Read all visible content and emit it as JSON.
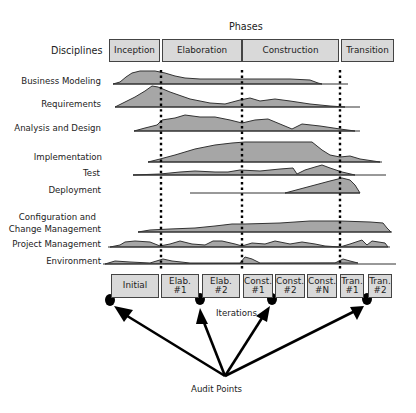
{
  "title": "Phases",
  "disciplines_header": "Disciplines",
  "phases": [
    {
      "label": "Inception"
    },
    {
      "label": "Elaboration"
    },
    {
      "label": "Construction"
    },
    {
      "label": "Transition"
    }
  ],
  "disciplines": [
    {
      "label": "Business Modeling"
    },
    {
      "label": "Requirements"
    },
    {
      "label": "Analysis and Design"
    },
    {
      "label": "Implementation"
    },
    {
      "label": "Test"
    },
    {
      "label": "Deployment"
    },
    {
      "label_line1": "Configuration and",
      "label_line2": "Change Management"
    },
    {
      "label": "Project Management"
    },
    {
      "label": "Environment"
    }
  ],
  "iterations": [
    {
      "line1": "Initial",
      "line2": ""
    },
    {
      "line1": "Elab. #1",
      "line2": ""
    },
    {
      "line1": "Elab. #2",
      "line2": ""
    },
    {
      "line1": "Const.",
      "line2": "#1"
    },
    {
      "line1": "Const.",
      "line2": "#2"
    },
    {
      "line1": "Const.",
      "line2": "#N"
    },
    {
      "line1": "Tran.",
      "line2": "#1"
    },
    {
      "line1": "Tran.",
      "line2": "#2"
    }
  ],
  "iterations_label": "Iterations",
  "audit_points_label": "Audit Points",
  "colors": {
    "fill": "#a6a6a6",
    "box": "#d9d9d9",
    "stroke": "#333333"
  }
}
